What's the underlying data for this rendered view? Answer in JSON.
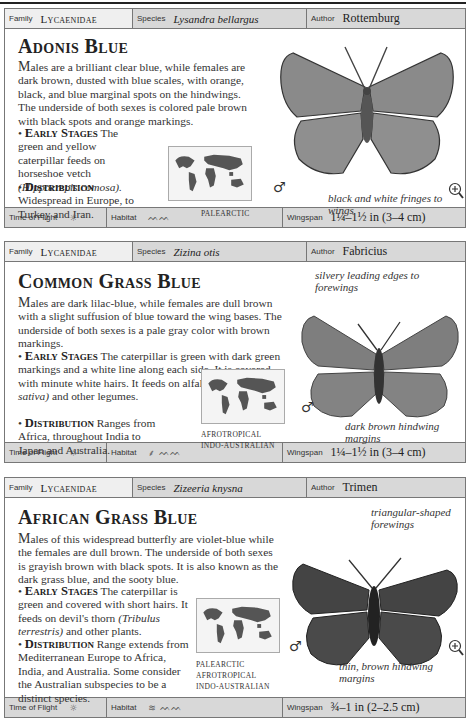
{
  "entries": [
    {
      "family_label": "Family",
      "family": "Lycaenidae",
      "species_label": "Species",
      "species": "Lysandra bellargus",
      "author_label": "Author",
      "author": "Rottemburg",
      "title": "Adonis Blue",
      "desc_cap": "M",
      "desc": "ales are a brilliant clear blue, while females are dark brown, dusted with blue scales, with orange, black, and blue marginal spots on the hindwings. The underside of both sexes is colored pale brown with black spots and orange markings.",
      "early_label": "Early Stages",
      "early_pre": "The green and yellow caterpillar feeds on horseshoe vetch",
      "early_italic": "(Hippocrepis comosa).",
      "early_post": "",
      "dist_label": "Distribution",
      "dist": "Widespread in Europe, to Turkey and Iran.",
      "regions": [
        "PALEARCTIC"
      ],
      "sex_symbol": "♂",
      "notes": [
        "black and white fringes to wings"
      ],
      "time_of_flight_label": "Time of Flight",
      "time_icon": "sun-icon",
      "habitat_label": "Habitat",
      "habitat_icons": [
        "grassland-icon"
      ],
      "wingspan_label": "Wingspan",
      "wingspan": "1¼–1½ in (3–4 cm)",
      "has_zoom_icon": true
    },
    {
      "family_label": "Family",
      "family": "Lycaenidae",
      "species_label": "Species",
      "species": "Zizina otis",
      "author_label": "Author",
      "author": "Fabricius",
      "title": "Common Grass Blue",
      "desc_cap": "M",
      "desc": "ales are dark lilac-blue, while females are dull brown with a slight suffusion of blue toward the wing bases. The underside of both sexes is a pale gray color with brown markings.",
      "early_label": "Early Stages",
      "early_pre": "The caterpillar is green with dark green markings and a white line along each side. It is covered with minute white hairs. It feeds on alfalfa",
      "early_italic": "(Medicago sativa)",
      "early_post": "and other legumes.",
      "dist_label": "Distribution",
      "dist": "Ranges from Africa, throughout India to Japan and Australia.",
      "regions": [
        "AFROTROPICAL",
        "INDO-AUSTRALIAN"
      ],
      "sex_symbol": "♂",
      "notes": [
        "silvery leading edges to forewings",
        "dark brown hindwing margins"
      ],
      "time_of_flight_label": "Time of Flight",
      "time_icon": "sun-icon",
      "habitat_label": "Habitat",
      "habitat_icons": [
        "plant-icon",
        "grassland-icon"
      ],
      "wingspan_label": "Wingspan",
      "wingspan": "1¼–1½ in (3–4 cm)",
      "has_zoom_icon": false
    },
    {
      "family_label": "Family",
      "family": "Lycaenidae",
      "species_label": "Species",
      "species": "Zizeeria knysna",
      "author_label": "Author",
      "author": "Trimen",
      "title": "African Grass Blue",
      "desc_cap": "M",
      "desc": "ales of this widespread butterfly are violet-blue while the females are dull brown. The underside of both sexes is grayish brown with black spots. It is also known as the dark grass blue, and the sooty blue.",
      "early_label": "Early Stages",
      "early_pre": "The caterpillar is green and covered with short hairs. It feeds on devil's thorn",
      "early_italic": "(Tribulus terrestris)",
      "early_post": "and other plants.",
      "dist_label": "Distribution",
      "dist": "Range extends from Mediterranean Europe to Africa, India, and Australia. Some consider the Australian subspecies to be a distinct species.",
      "regions": [
        "PALEARCTIC",
        "AFROTROPICAL",
        "INDO-AUSTRALIAN"
      ],
      "sex_symbol": "♂",
      "notes": [
        "triangular-shaped forewings",
        "thin, brown hindwing margins"
      ],
      "time_of_flight_label": "Time of Flight",
      "time_icon": "sun-icon",
      "habitat_label": "Habitat",
      "habitat_icons": [
        "wetland-icon",
        "grassland-icon"
      ],
      "wingspan_label": "Wingspan",
      "wingspan": "¾–1 in (2–2.5 cm)",
      "has_zoom_icon": true
    }
  ]
}
